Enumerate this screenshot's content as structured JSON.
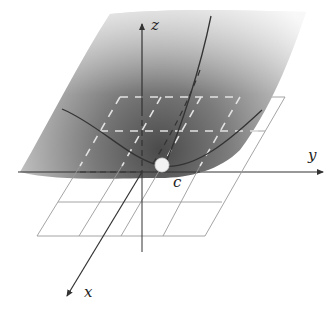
{
  "figure": {
    "labels": {
      "z_axis": "z",
      "y_axis": "y",
      "x_axis": "x",
      "point": "c"
    },
    "colors": {
      "surface_dark": "#555555",
      "surface_light": "#e8e8e8",
      "axis": "#333333",
      "grid": "#9a9a9a",
      "grid_dashed_on_surface": "#dddddd",
      "point_fill": "#f2f2f2",
      "curve": "#333333"
    },
    "elements": [
      "shaded surface",
      "tangent plane grid (4x2 cells)",
      "z axis",
      "y axis",
      "x axis",
      "level curve through c along y",
      "level curve through c along x",
      "point c"
    ]
  }
}
